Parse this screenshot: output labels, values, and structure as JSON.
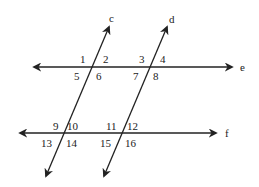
{
  "diagram": {
    "colors": {
      "line": "#222222",
      "background": "#ffffff"
    },
    "lines": {
      "e": {
        "label": "e"
      },
      "f": {
        "label": "f"
      },
      "c": {
        "label": "c"
      },
      "d": {
        "label": "d"
      }
    },
    "angles": {
      "a1": "1",
      "a2": "2",
      "a3": "3",
      "a4": "4",
      "a5": "5",
      "a6": "6",
      "a7": "7",
      "a8": "8",
      "a9": "9",
      "a10": "10",
      "a11": "11",
      "a12": "12",
      "a13": "13",
      "a14": "14",
      "a15": "15",
      "a16": "16"
    }
  }
}
